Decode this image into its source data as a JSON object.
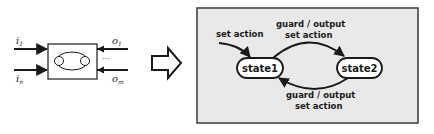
{
  "left_block": {
    "inputs": [
      {
        "name": "i",
        "sub": "1"
      },
      {
        "name": "i",
        "sub": "n"
      }
    ],
    "outputs": [
      {
        "name": "o",
        "sub": "1"
      },
      {
        "name": "o",
        "sub": "m"
      }
    ],
    "ellipsis": "···"
  },
  "transform_arrow": "hollow-right-arrow",
  "state_machine": {
    "background": "#e9e9e9",
    "states": [
      {
        "id": "state1",
        "label": "state1"
      },
      {
        "id": "state2",
        "label": "state2"
      }
    ],
    "initial_transition": {
      "label": "set action"
    },
    "transitions": [
      {
        "from": "state1",
        "to": "state2",
        "label_line1": "guard / output",
        "label_line2": "set action"
      },
      {
        "from": "state2",
        "to": "state1",
        "label_line1": "guard / output",
        "label_line2": "set action"
      }
    ]
  }
}
